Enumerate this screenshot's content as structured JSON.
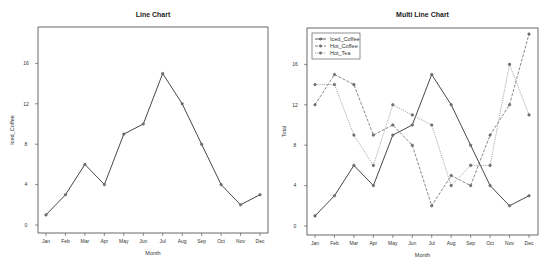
{
  "chart_data": [
    {
      "type": "line",
      "title": "Line Chart",
      "xlabel": "Month",
      "ylabel": "Iced_Coffee",
      "categories": [
        "Jan",
        "Feb",
        "Mar",
        "Apr",
        "May",
        "Jun",
        "Jul",
        "Aug",
        "Sep",
        "Oct",
        "Nov",
        "Dec"
      ],
      "yticks": [
        0,
        4,
        8,
        12,
        16
      ],
      "ylim": [
        0,
        16
      ],
      "grid": false,
      "legend": null,
      "series": [
        {
          "name": "Iced_Coffee",
          "values": [
            1,
            3,
            6,
            4,
            9,
            10,
            15,
            12,
            8,
            4,
            2,
            3
          ],
          "line_style": "solid",
          "color": "#333333"
        }
      ]
    },
    {
      "type": "line",
      "title": "Multi Line Chart",
      "xlabel": "Month",
      "ylabel": "Total",
      "categories": [
        "Jan",
        "Feb",
        "Mar",
        "Apr",
        "May",
        "Jun",
        "Jul",
        "Aug",
        "Sep",
        "Oct",
        "Nov",
        "Dec"
      ],
      "yticks": [
        0,
        4,
        8,
        12,
        16
      ],
      "ylim": [
        0,
        19
      ],
      "grid": false,
      "legend": {
        "position": "top-left",
        "entries": [
          "Iced_Coffee",
          "Hot_Coffee",
          "Hot_Tea"
        ]
      },
      "series": [
        {
          "name": "Iced_Coffee",
          "values": [
            1,
            3,
            6,
            4,
            9,
            10,
            15,
            12,
            8,
            4,
            2,
            3
          ],
          "line_style": "solid",
          "color": "#333333"
        },
        {
          "name": "Hot_Coffee",
          "values": [
            12,
            15,
            14,
            9,
            10,
            8,
            2,
            5,
            4,
            9,
            12,
            19
          ],
          "line_style": "dashed",
          "color": "#555555"
        },
        {
          "name": "Hot_Tea",
          "values": [
            14,
            14,
            9,
            6,
            12,
            11,
            10,
            4,
            6,
            6,
            16,
            11
          ],
          "line_style": "dotted",
          "color": "#888888"
        }
      ]
    }
  ],
  "layout": [
    {
      "box": {
        "x": 38,
        "y": 27,
        "w": 230,
        "h": 206
      },
      "x0": 46,
      "x1": 260,
      "y0px": 225,
      "ypx_per_unit": 10.1,
      "title_y": 17,
      "xlabel_y": 255,
      "ylabel_x": 14
    },
    {
      "box": {
        "x": 307,
        "y": 28,
        "w": 231,
        "h": 207
      },
      "x0": 315,
      "x1": 529,
      "y0px": 226,
      "ypx_per_unit": 10.1,
      "title_y": 17,
      "xlabel_y": 257,
      "ylabel_x": 286
    }
  ]
}
